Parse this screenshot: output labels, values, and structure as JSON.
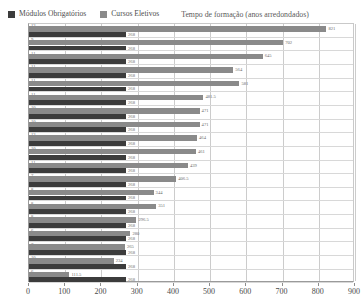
{
  "legend": {
    "series": [
      {
        "label": "Módulos Obrigatórios",
        "color": "#3c3c3c",
        "swatch_name": "legend-swatch-modulos"
      },
      {
        "label": "Cursos Eletivos",
        "color": "#8a8a8a",
        "swatch_name": "legend-swatch-eletivos"
      }
    ],
    "note": "Tempo de formação (anos arredondados)"
  },
  "chart_data": {
    "type": "bar",
    "orientation": "horizontal",
    "title": "",
    "subtitle": "",
    "xlabel": "",
    "ylabel": "",
    "xlim": [
      0,
      900
    ],
    "xticks": [
      0,
      100,
      200,
      300,
      400,
      500,
      600,
      700,
      800,
      900
    ],
    "xtick_labels": [
      "0",
      "100",
      "200",
      "300",
      "400",
      "500",
      "600",
      "700",
      "800",
      "900"
    ],
    "grid": true,
    "grid_axis": "x",
    "legend_position": "top-left",
    "annotation": "Tempo de formação (anos arredondados)",
    "categories": [
      "12",
      "9",
      "11",
      "11",
      "11",
      "11",
      "10",
      "10",
      "12",
      "10",
      "11",
      "7",
      "8",
      "8",
      "8",
      "6",
      "7",
      "10",
      "6"
    ],
    "category_labels": [
      "12",
      "9",
      "11",
      "11",
      "11",
      "11",
      "10",
      "10",
      "12",
      "10",
      "11",
      "7",
      "8",
      "8",
      "8",
      "6",
      "7",
      "10",
      "6"
    ],
    "series": [
      {
        "name": "Cursos Eletivos",
        "color": "#8a8a8a",
        "values": [
          821,
          702,
          645,
          564,
          581,
          481.5,
          471,
          471,
          464,
          461,
          439,
          406.5,
          344,
          351,
          296.5,
          280,
          265,
          234,
          111.5
        ],
        "value_labels": [
          "821",
          "702",
          "645",
          "564",
          "581",
          "481.5",
          "471",
          "471",
          "464",
          "461",
          "439",
          "406.5",
          "344",
          "351",
          "296.5",
          "280",
          "265",
          "234",
          "111.5"
        ]
      },
      {
        "name": "Módulos Obrigatórios",
        "color": "#3c3c3c",
        "values": [
          268,
          268,
          268,
          268,
          268,
          268,
          268,
          268,
          268,
          268,
          268,
          268,
          268,
          268,
          268,
          268,
          268,
          268,
          268
        ],
        "value_labels": [
          "268",
          "268",
          "268",
          "268",
          "268",
          "268",
          "268",
          "268",
          "268",
          "268",
          "268",
          "268",
          "268",
          "268",
          "268",
          "268",
          "268",
          "268",
          "268"
        ]
      }
    ]
  }
}
